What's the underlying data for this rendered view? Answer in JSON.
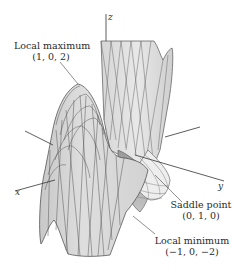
{
  "figure": {
    "axes": {
      "x": "x",
      "y": "y",
      "z": "z"
    },
    "annotations": [
      {
        "id": "local-max",
        "label": "Local maximum",
        "coords": "(1, 0, 2)"
      },
      {
        "id": "saddle",
        "label": "Saddle point",
        "coords": "(0, 1, 0)"
      },
      {
        "id": "local-min",
        "label": "Local minimum",
        "coords": "(−1, 0, −2)"
      }
    ]
  }
}
